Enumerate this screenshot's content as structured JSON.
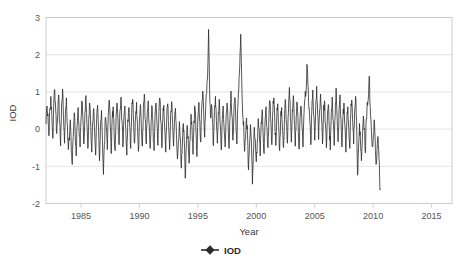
{
  "chart_data": {
    "type": "line",
    "title": "",
    "xlabel": "Year",
    "ylabel": "IOD",
    "xlim": [
      1982.0,
      2016.75
    ],
    "ylim": [
      -2,
      3
    ],
    "xticks": [
      1985,
      1990,
      1995,
      2000,
      2005,
      2010,
      2015
    ],
    "xticklabels": [
      "1985",
      "1990",
      "1995",
      "2000",
      "2005",
      "2010",
      "2015"
    ],
    "yticks": [
      -2,
      -1,
      0,
      1,
      2,
      3
    ],
    "yticklabels": [
      "-2",
      "-1",
      "0",
      "1",
      "2",
      "3"
    ],
    "grid": "horizontal",
    "legend": {
      "position": "bottom-center",
      "entries": [
        {
          "name": "IOD",
          "color": "#2b2b2b",
          "marker": "diamond",
          "line": "solid"
        }
      ]
    },
    "series": [
      {
        "name": "IOD",
        "color": "#2b2b2b",
        "linewidth": 0.8,
        "x_start": 1982.0,
        "x_step": 0.08333333,
        "notes": "Monthly Indian Ocean Dipole index, Jan 1982 - Sep 2016",
        "values": [
          0.15,
          0.62,
          0.41,
          -0.18,
          0.55,
          0.88,
          0.34,
          -0.25,
          0.71,
          1.05,
          0.48,
          -0.12,
          0.36,
          0.92,
          0.2,
          -0.45,
          0.62,
          1.08,
          0.3,
          -0.38,
          0.5,
          0.84,
          0.12,
          -0.55,
          -0.3,
          0.25,
          -0.62,
          -0.95,
          -0.2,
          0.44,
          -0.15,
          -0.72,
          0.1,
          0.58,
          -0.08,
          -0.48,
          0.3,
          0.75,
          0.22,
          -0.4,
          0.48,
          0.9,
          0.18,
          -0.52,
          0.34,
          0.68,
          0.05,
          -0.62,
          0.2,
          0.55,
          -0.1,
          -0.7,
          0.25,
          0.64,
          -0.05,
          -0.85,
          0.15,
          0.5,
          -0.28,
          -1.22,
          -0.42,
          0.32,
          0.05,
          -0.55,
          0.4,
          0.78,
          0.1,
          -0.66,
          0.28,
          0.6,
          -0.12,
          -0.58,
          0.35,
          0.7,
          0.18,
          -0.42,
          0.52,
          0.86,
          0.22,
          -0.48,
          0.3,
          0.62,
          -0.02,
          -0.7,
          0.25,
          0.58,
          0.08,
          -0.52,
          0.44,
          0.8,
          0.16,
          -0.38,
          0.36,
          0.72,
          0.1,
          -0.6,
          0.3,
          0.66,
          0.02,
          -0.46,
          0.55,
          0.94,
          0.26,
          -0.4,
          0.42,
          0.76,
          0.14,
          -0.52,
          0.22,
          0.6,
          -0.06,
          -0.58,
          0.38,
          0.7,
          0.12,
          -0.44,
          0.48,
          0.82,
          0.2,
          -0.5,
          0.28,
          0.64,
          0.0,
          -0.62,
          0.34,
          0.68,
          0.05,
          -0.55,
          0.4,
          0.74,
          0.15,
          -0.46,
          0.25,
          0.56,
          -0.15,
          -0.8,
          -0.35,
          0.2,
          -0.25,
          -1.05,
          -0.5,
          0.15,
          -0.3,
          -1.32,
          -0.55,
          0.1,
          -0.2,
          -0.92,
          -0.28,
          0.4,
          0.02,
          -0.68,
          0.22,
          0.58,
          -0.05,
          -0.74,
          0.3,
          0.72,
          0.2,
          -0.35,
          0.62,
          1.02,
          0.4,
          -0.22,
          0.55,
          0.95,
          1.45,
          2.68,
          1.1,
          0.3,
          0.66,
          0.18,
          -0.45,
          0.5,
          0.88,
          0.24,
          -0.38,
          0.44,
          0.8,
          0.12,
          -0.56,
          0.26,
          0.62,
          0.0,
          -0.48,
          0.38,
          0.7,
          0.14,
          -0.52,
          0.3,
          1.02,
          0.35,
          -0.3,
          0.45,
          0.85,
          0.22,
          -0.4,
          0.58,
          1.08,
          1.7,
          2.55,
          1.35,
          0.4,
          0.2,
          -0.6,
          -0.25,
          0.3,
          -0.18,
          -1.1,
          -0.45,
          0.12,
          -0.35,
          -1.48,
          -0.62,
          0.05,
          -0.28,
          -0.88,
          -0.35,
          0.28,
          -0.02,
          -0.72,
          0.18,
          0.52,
          -0.1,
          -0.66,
          0.24,
          0.6,
          0.05,
          -0.5,
          0.36,
          0.74,
          0.18,
          -0.42,
          0.48,
          0.84,
          0.2,
          -0.44,
          0.32,
          0.68,
          0.08,
          -0.58,
          0.26,
          0.58,
          -0.04,
          -0.5,
          0.4,
          0.78,
          0.16,
          -0.38,
          0.44,
          1.12,
          0.3,
          -0.35,
          0.52,
          0.9,
          0.24,
          -0.46,
          0.34,
          0.7,
          0.1,
          -0.54,
          0.28,
          0.62,
          0.02,
          -0.48,
          0.42,
          0.82,
          0.95,
          1.74,
          1.2,
          0.55,
          0.2,
          -0.42,
          0.48,
          1.05,
          0.36,
          -0.3,
          0.6,
          1.15,
          0.4,
          -0.28,
          0.52,
          0.94,
          0.28,
          -0.4,
          0.38,
          0.76,
          0.14,
          -0.5,
          0.3,
          0.66,
          0.06,
          -0.56,
          0.44,
          0.86,
          0.22,
          -0.44,
          0.36,
          1.1,
          0.32,
          -0.34,
          0.5,
          0.92,
          0.26,
          -0.48,
          0.32,
          0.7,
          0.1,
          -0.62,
          0.24,
          0.6,
          0.0,
          -0.52,
          0.38,
          0.78,
          0.18,
          -0.4,
          0.46,
          0.88,
          0.24,
          -1.24,
          -0.5,
          0.15,
          -0.3,
          -0.85,
          -0.25,
          0.35,
          0.02,
          -0.64,
          0.28,
          0.72,
          0.8,
          1.42,
          0.6,
          0.1,
          -0.45,
          -0.3,
          0.25,
          -0.2,
          -0.95,
          -0.55,
          -0.2,
          -0.78,
          -1.62
        ]
      }
    ]
  }
}
